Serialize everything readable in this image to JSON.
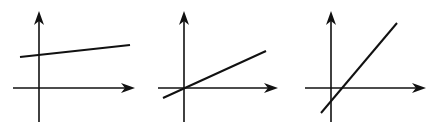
{
  "diagram": {
    "colors": {
      "ink": "#111111",
      "background": "#ffffff"
    },
    "graphs": [
      {
        "name": "graph-1",
        "label": "Shallow positive slope, positive y-intercept",
        "axes": {
          "origin": [
            39,
            88
          ],
          "x_from": 13,
          "x_to": 135,
          "y_from": 122,
          "y_to": 11
        },
        "line": {
          "x1": 20,
          "y1": 57,
          "x2": 130,
          "y2": 45
        }
      },
      {
        "name": "graph-2",
        "label": "Moderate positive slope through origin",
        "axes": {
          "origin": [
            184,
            88
          ],
          "x_from": 158,
          "x_to": 278,
          "y_from": 122,
          "y_to": 11
        },
        "line": {
          "x1": 163,
          "y1": 98,
          "x2": 266,
          "y2": 51
        }
      },
      {
        "name": "graph-3",
        "label": "Steep positive slope, negative y-intercept",
        "axes": {
          "origin": [
            331,
            88
          ],
          "x_from": 305,
          "x_to": 426,
          "y_from": 122,
          "y_to": 11
        },
        "line": {
          "x1": 321,
          "y1": 113,
          "x2": 397,
          "y2": 23
        }
      }
    ]
  }
}
